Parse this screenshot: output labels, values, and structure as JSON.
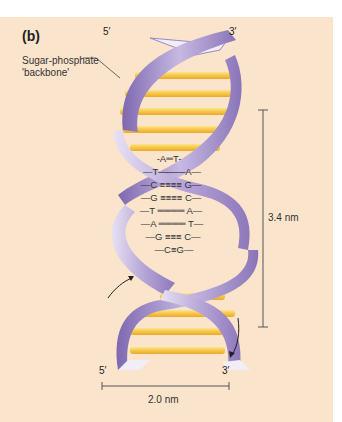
{
  "figure": {
    "panel_label": "(b)",
    "backbone_label_line1": "Sugar-phosphate",
    "backbone_label_line2": "'backbone'",
    "top_left_end": "5′",
    "top_right_end": "3′",
    "bottom_left_end": "5′",
    "bottom_right_end": "3′",
    "pitch_label": "3.4 nm",
    "width_label": "2.0 nm",
    "base_pairs": [
      {
        "left": "A",
        "right": "T",
        "bond": "═"
      },
      {
        "left": "T",
        "right": "A",
        "bond": "═"
      },
      {
        "left": "C",
        "right": "G",
        "bond": "≡"
      },
      {
        "left": "G",
        "right": "C",
        "bond": "≡"
      },
      {
        "left": "T",
        "right": "A",
        "bond": "═"
      },
      {
        "left": "A",
        "right": "T",
        "bond": "═"
      },
      {
        "left": "G",
        "right": "C",
        "bond": "≡"
      },
      {
        "left": "C",
        "right": "G",
        "bond": "≡"
      }
    ],
    "colors": {
      "background": "#fbe4cc",
      "backbone": "#9b86c4",
      "backbone_light": "#d9d0ea",
      "bases": "#f6c64a"
    }
  }
}
